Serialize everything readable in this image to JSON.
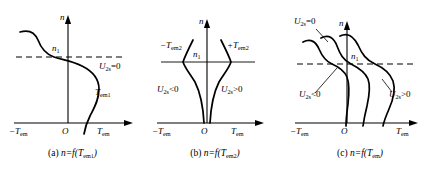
{
  "figure": {
    "panels": [
      {
        "id": "a",
        "caption_prefix": "(a)",
        "caption_fn": "n=f(T",
        "caption_sub": "em1",
        "caption_close": ")",
        "axis": {
          "y_label": "n",
          "origin_label": "O",
          "x_label_right": "T",
          "x_label_right_sub": "em",
          "x_label_left": "−T",
          "x_label_left_sub": "em"
        },
        "markers": [
          {
            "name": "n1",
            "text": "n",
            "sub": "1"
          }
        ],
        "curve_labels": [
          {
            "name": "u2s-zero",
            "text": "U",
            "sub": "2s",
            "op": "=0"
          },
          {
            "name": "tem1",
            "text": "T",
            "sub": "em1",
            "op": ""
          }
        ]
      },
      {
        "id": "b",
        "caption_prefix": "(b)",
        "caption_fn": "n=f(T",
        "caption_sub": "em2",
        "caption_close": ")",
        "axis": {
          "y_label": "n",
          "origin_label": "O",
          "x_label_right": "T",
          "x_label_right_sub": "em",
          "x_label_left": "−T",
          "x_label_left_sub": "em"
        },
        "markers": [
          {
            "name": "n1",
            "text": "n",
            "sub": "1"
          }
        ],
        "curve_labels": [
          {
            "name": "neg-tem2",
            "text": "−T",
            "sub": "em2",
            "op": ""
          },
          {
            "name": "pos-tem2",
            "text": "+T",
            "sub": "em2",
            "op": ""
          },
          {
            "name": "u2s-negative",
            "text": "U",
            "sub": "2s",
            "op": "<0"
          },
          {
            "name": "u2s-positive",
            "text": "U",
            "sub": "2s",
            "op": ">0"
          }
        ]
      },
      {
        "id": "c",
        "caption_prefix": "(c)",
        "caption_fn": "n=f(T",
        "caption_sub": "em",
        "caption_close": ")",
        "axis": {
          "y_label": "n",
          "origin_label": "O",
          "x_label_right": "T",
          "x_label_right_sub": "em",
          "x_label_left": "−T",
          "x_label_left_sub": "em"
        },
        "markers": [
          {
            "name": "n1",
            "text": "n",
            "sub": "1"
          }
        ],
        "curve_labels": [
          {
            "name": "u2s-zero",
            "text": "U",
            "sub": "2s",
            "op": "=0"
          },
          {
            "name": "u2s-negative",
            "text": "U",
            "sub": "2s",
            "op": "<0"
          },
          {
            "name": "u2s-positive",
            "text": "U",
            "sub": "2s",
            "op": ">0"
          }
        ]
      }
    ],
    "style": {
      "stroke": "#000000",
      "dash_color": "#000000",
      "background": "#ffffff"
    }
  }
}
